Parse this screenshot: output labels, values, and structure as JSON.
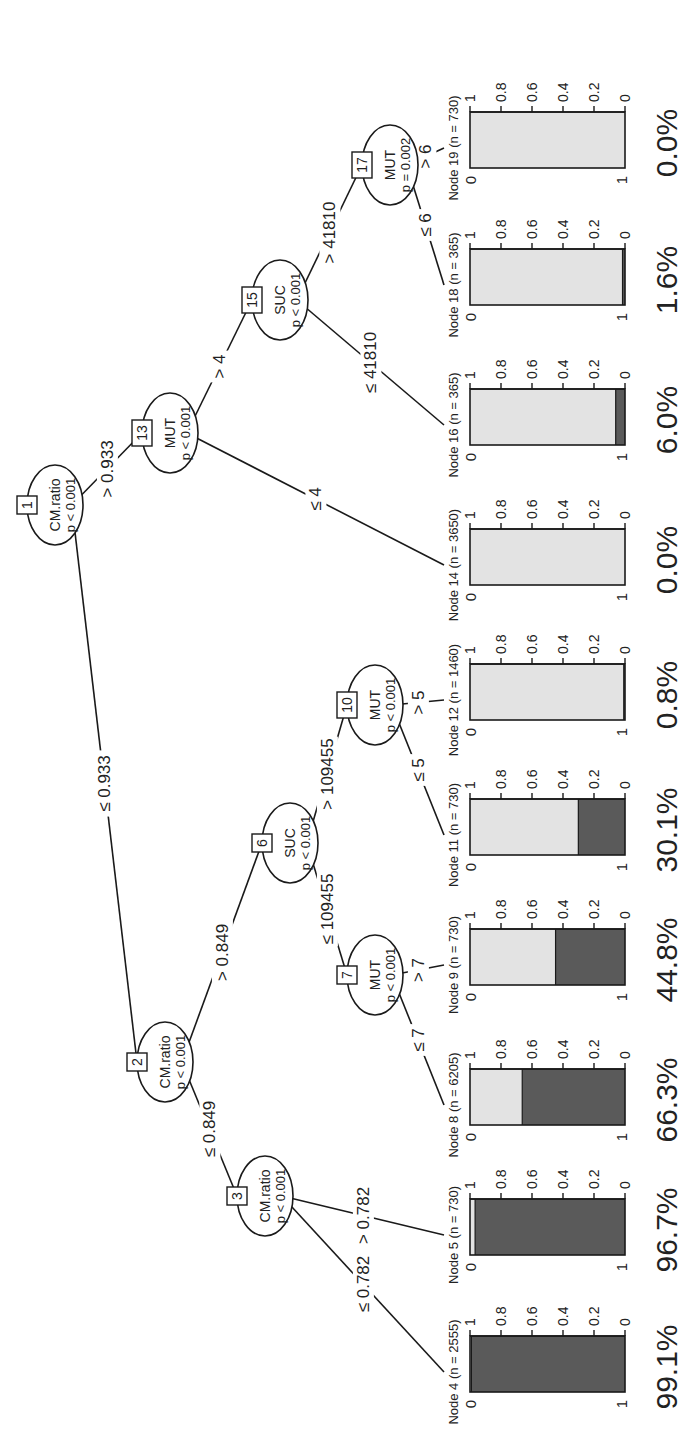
{
  "figure": {
    "type": "conditional inference tree",
    "orientation": "rotated 90 degrees counter-clockwise",
    "colors": {
      "dark": "#5a5a5a",
      "light": "#e3e3e3",
      "line": "#1a1a1a"
    }
  },
  "inner_nodes": [
    {
      "id": "1",
      "var": "CM.ratio",
      "p": "p < 0.001",
      "x": 943,
      "y": 55
    },
    {
      "id": "2",
      "var": "CM.ratio",
      "p": "p < 0.001",
      "x": 386,
      "y": 165
    },
    {
      "id": "3",
      "var": "CM.ratio",
      "p": "p < 0.001",
      "x": 252,
      "y": 265
    },
    {
      "id": "6",
      "var": "SUC",
      "p": "p < 0.001",
      "x": 605,
      "y": 290
    },
    {
      "id": "7",
      "var": "MUT",
      "p": "p < 0.001",
      "x": 473,
      "y": 375
    },
    {
      "id": "10",
      "var": "MUT",
      "p": "p < 0.001",
      "x": 743,
      "y": 375
    },
    {
      "id": "13",
      "var": "MUT",
      "p": "p < 0.001",
      "x": 1015,
      "y": 170
    },
    {
      "id": "15",
      "var": "SUC",
      "p": "p < 0.001",
      "x": 1148,
      "y": 280
    },
    {
      "id": "17",
      "var": "MUT",
      "p": "p = 0.002",
      "x": 1283,
      "y": 390
    }
  ],
  "edges": [
    {
      "from": "1",
      "to": "2",
      "label": "≤ 0.933"
    },
    {
      "from": "1",
      "to": "13",
      "label": "> 0.933"
    },
    {
      "from": "2",
      "to": "3",
      "label": "≤ 0.849"
    },
    {
      "from": "2",
      "to": "6",
      "label": "> 0.849"
    },
    {
      "from": "3",
      "to": "4",
      "label": "≤ 0.782"
    },
    {
      "from": "3",
      "to": "5",
      "label": "> 0.782"
    },
    {
      "from": "6",
      "to": "7",
      "label": "≤ 109455"
    },
    {
      "from": "6",
      "to": "10",
      "label": "> 109455"
    },
    {
      "from": "7",
      "to": "8",
      "label": "≤ 7"
    },
    {
      "from": "7",
      "to": "9",
      "label": "> 7"
    },
    {
      "from": "10",
      "to": "11",
      "label": "≤ 5"
    },
    {
      "from": "10",
      "to": "12",
      "label": "> 5"
    },
    {
      "from": "13",
      "to": "14",
      "label": "≤ 4"
    },
    {
      "from": "13",
      "to": "15",
      "label": "> 4"
    },
    {
      "from": "15",
      "to": "16",
      "label": "≤ 41810"
    },
    {
      "from": "15",
      "to": "17",
      "label": "> 41810"
    },
    {
      "from": "17",
      "to": "18",
      "label": "≤ 6"
    },
    {
      "from": "17",
      "to": "19",
      "label": "> 6"
    }
  ],
  "terminal_nodes": [
    {
      "id": "4",
      "label": "Node 4 (n = 2555)",
      "n": 2555,
      "class1_share": 0.991,
      "pct": "99.1%",
      "x": 76
    },
    {
      "id": "5",
      "label": "Node 5 (n = 730)",
      "n": 730,
      "class1_share": 0.967,
      "pct": "96.7%",
      "x": 213
    },
    {
      "id": "8",
      "label": "Node 8 (n = 6205)",
      "n": 6205,
      "class1_share": 0.663,
      "pct": "66.3%",
      "x": 343
    },
    {
      "id": "9",
      "label": "Node 9 (n = 730)",
      "n": 730,
      "class1_share": 0.448,
      "pct": "44.8%",
      "x": 483
    },
    {
      "id": "11",
      "label": "Node 11 (n = 730)",
      "n": 730,
      "class1_share": 0.301,
      "pct": "30.1%",
      "x": 613
    },
    {
      "id": "12",
      "label": "Node 12 (n = 1460)",
      "n": 1460,
      "class1_share": 0.008,
      "pct": "0.8%",
      "x": 748
    },
    {
      "id": "14",
      "label": "Node 14 (n = 3650)",
      "n": 3650,
      "class1_share": 0.0,
      "pct": "0.0%",
      "x": 883
    },
    {
      "id": "16",
      "label": "Node 16 (n = 365)",
      "n": 365,
      "class1_share": 0.06,
      "pct": "6.0%",
      "x": 1023
    },
    {
      "id": "18",
      "label": "Node 18 (n = 365)",
      "n": 365,
      "class1_share": 0.016,
      "pct": "1.6%",
      "x": 1163
    },
    {
      "id": "19",
      "label": "Node 19 (n = 730)",
      "n": 730,
      "class1_share": 0.0,
      "pct": "0.0%",
      "x": 1300
    }
  ],
  "bar_axis": {
    "ticks": [
      "0",
      "0.2",
      "0.4",
      "0.6",
      "0.8",
      "1"
    ],
    "categories": [
      "0",
      "1"
    ]
  }
}
